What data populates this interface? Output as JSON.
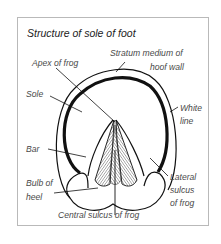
{
  "title": "Structure of sole of foot",
  "labels": {
    "stratum_line1": "Stratum medium of",
    "stratum_line2": "hoof wall",
    "apex": "Apex of frog",
    "sole": "Sole",
    "white_line1": "White",
    "white_line2": "line",
    "bar": "Bar",
    "bulb_line1": "Bulb of",
    "bulb_line2": "heel",
    "lateral_line1": "Lateral",
    "lateral_line2": "sulcus",
    "lateral_line3": "of frog",
    "central": "Central sulcus of frog"
  },
  "colors": {
    "stroke": "#111111",
    "frame": "#b9b9b9",
    "text": "#4a4a4a"
  }
}
